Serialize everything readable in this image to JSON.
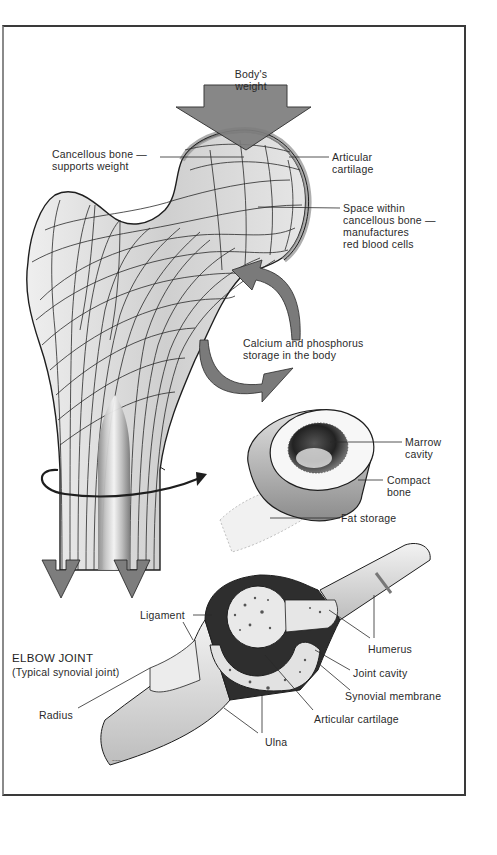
{
  "figure": {
    "colors": {
      "frame": "#3a3a3a",
      "arrow_fill": "#7d7d7d",
      "bone_fill": "#d9d9d9",
      "line": "#1e1e1e",
      "background": "#ffffff"
    }
  },
  "femur_section": {
    "weight_label": [
      "Body's",
      "weight"
    ],
    "labels": {
      "cancellous": [
        "Cancellous bone —",
        "supports weight"
      ],
      "articular": [
        "Articular",
        "cartilage"
      ],
      "space": [
        "Space within",
        "cancellous bone —",
        "manufactures",
        "red blood cells"
      ],
      "calcium": [
        "Calcium and phosphorus",
        "storage in the body"
      ]
    }
  },
  "cross_section": {
    "labels": {
      "marrow": [
        "Marrow",
        "cavity"
      ],
      "compact": [
        "Compact",
        "bone"
      ],
      "fat": "Fat storage"
    }
  },
  "elbow": {
    "title": "ELBOW JOINT",
    "subtitle": "(Typical synovial joint)",
    "labels": {
      "ligament": "Ligament",
      "humerus": "Humerus",
      "joint_cavity": "Joint cavity",
      "synovial": "Synovial membrane",
      "articular": "Articular cartilage",
      "radius": "Radius",
      "ulna": "Ulna"
    }
  }
}
